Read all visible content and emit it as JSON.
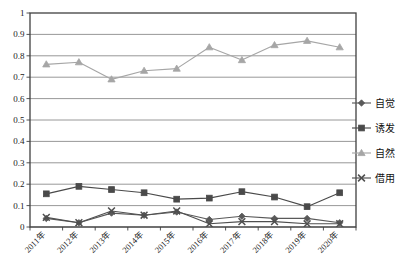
{
  "chart_data": {
    "type": "line",
    "title": "",
    "xlabel": "",
    "ylabel": "",
    "ylim": [
      0,
      1
    ],
    "ytick_step": 0.1,
    "grid": true,
    "legend_position": "right",
    "categories": [
      "2011年",
      "2012年",
      "2013年",
      "2014年",
      "2015年",
      "2016年",
      "2017年",
      "2018年",
      "2019年",
      "2020年"
    ],
    "ytick_labels": [
      "1",
      "0.9",
      "0.8",
      "0.7",
      "0.6",
      "0.5",
      "0.4",
      "0.3",
      "0.2",
      "0.1",
      "0"
    ],
    "ytick_values": [
      1,
      0.9,
      0.8,
      0.7,
      0.6,
      0.5,
      0.4,
      0.3,
      0.2,
      0.1,
      0
    ],
    "series": [
      {
        "name": "自觉",
        "marker": "diamond",
        "color": "#595959",
        "values": [
          0.04,
          0.02,
          0.065,
          0.055,
          0.07,
          0.035,
          0.05,
          0.04,
          0.04,
          0.02
        ]
      },
      {
        "name": "诱发",
        "marker": "square",
        "color": "#4a4a4a",
        "values": [
          0.155,
          0.19,
          0.175,
          0.16,
          0.13,
          0.135,
          0.165,
          0.14,
          0.095,
          0.16
        ]
      },
      {
        "name": "自然",
        "marker": "triangle",
        "color": "#a6a6a6",
        "values": [
          0.76,
          0.77,
          0.69,
          0.73,
          0.74,
          0.84,
          0.78,
          0.85,
          0.87,
          0.84
        ]
      },
      {
        "name": "借用",
        "marker": "cross-x",
        "color": "#4f4f4f",
        "values": [
          0.045,
          0.02,
          0.075,
          0.055,
          0.075,
          0.015,
          0.025,
          0.025,
          0.015,
          0.015
        ]
      }
    ]
  },
  "legend": {
    "items": [
      {
        "label": "自觉",
        "marker": "diamond-marker-icon",
        "color": "#595959"
      },
      {
        "label": "诱发",
        "marker": "square-marker-icon",
        "color": "#4a4a4a"
      },
      {
        "label": "自然",
        "marker": "triangle-marker-icon",
        "color": "#a6a6a6"
      },
      {
        "label": "借用",
        "marker": "cross-marker-icon",
        "color": "#4f4f4f"
      }
    ]
  },
  "colors": {
    "plot_border": "#404040",
    "gridline": "#8c8c8c",
    "axis_text": "#1a1a1a",
    "background": "#ffffff"
  }
}
